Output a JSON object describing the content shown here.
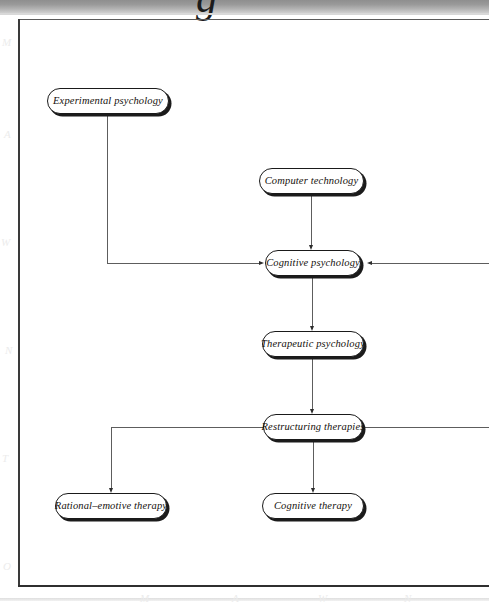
{
  "page": {
    "scan_band_glyph": "g",
    "background_color": "#ffffff",
    "frame_color": "#2f2f2f"
  },
  "diagram": {
    "type": "flowchart",
    "node_style": {
      "shape": "rounded-rectangle",
      "border_color": "#1a1a1a",
      "fill_color": "#ffffff",
      "shadow_color": "#1b1b1b",
      "text_style": "italic-serif"
    },
    "nodes": [
      {
        "id": "experimental-psychology",
        "label": "Experimental psychology"
      },
      {
        "id": "computer-technology",
        "label": "Computer technology"
      },
      {
        "id": "cognitive-psychology",
        "label": "Cognitive psychology"
      },
      {
        "id": "therapeutic-psychology",
        "label": "Therapeutic psychology"
      },
      {
        "id": "restructuring-therapies",
        "label": "Restructuring therapies"
      },
      {
        "id": "rational-emotive-therapy",
        "label": "Rational–emotive therapy"
      },
      {
        "id": "cognitive-therapy",
        "label": "Cognitive therapy"
      }
    ],
    "edges": [
      {
        "from": "experimental-psychology",
        "to": "cognitive-psychology",
        "routing": "down-then-right"
      },
      {
        "from": "computer-technology",
        "to": "cognitive-psychology",
        "routing": "straight-down"
      },
      {
        "from": "off-page-right",
        "to": "cognitive-psychology",
        "routing": "horizontal-left"
      },
      {
        "from": "cognitive-psychology",
        "to": "therapeutic-psychology",
        "routing": "straight-down"
      },
      {
        "from": "therapeutic-psychology",
        "to": "restructuring-therapies",
        "routing": "straight-down"
      },
      {
        "from": "restructuring-therapies",
        "to": "rational-emotive-therapy",
        "routing": "left-then-down"
      },
      {
        "from": "restructuring-therapies",
        "to": "cognitive-therapy",
        "routing": "straight-down"
      },
      {
        "from": "restructuring-therapies",
        "to": "off-page-right",
        "routing": "horizontal-right"
      }
    ]
  },
  "watermarks": [
    "M",
    "A",
    "W",
    "N",
    "T",
    "O"
  ]
}
